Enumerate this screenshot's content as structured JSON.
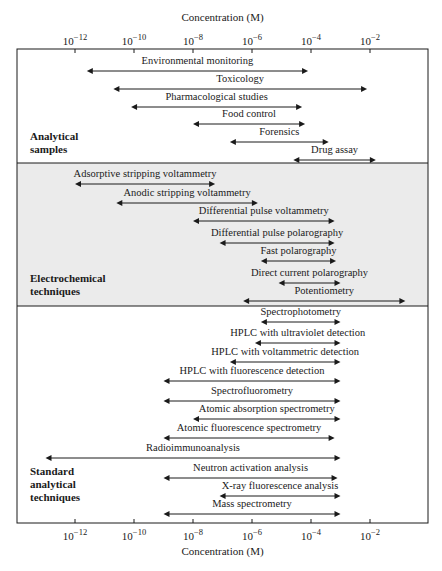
{
  "chart_data": {
    "type": "range-bar",
    "title": "",
    "xlabel": "Concentration (M)",
    "ylabel": "",
    "xscale": "log10",
    "xlim_exponent": [
      -13.5,
      -0.5
    ],
    "x_ticks": [
      -12,
      -10,
      -8,
      -6,
      -4,
      -2
    ],
    "x_tick_labels": [
      "10−12",
      "10−10",
      "10−8",
      "10−6",
      "10−4",
      "10−2"
    ],
    "top_axis": true,
    "bottom_axis": true,
    "groups": [
      {
        "name": "Analytical samples",
        "label_lines": [
          "Analytical",
          "samples"
        ],
        "shaded": false,
        "items": [
          {
            "label": "Environmental monitoring",
            "log_min": -11.6,
            "log_max": -4.1
          },
          {
            "label": "Toxicology",
            "log_min": -10.7,
            "log_max": -2.1
          },
          {
            "label": "Pharmacological studies",
            "log_min": -10.1,
            "log_max": -4.3
          },
          {
            "label": "Food control",
            "log_min": -8.0,
            "log_max": -4.2
          },
          {
            "label": "Forensics",
            "log_min": -6.75,
            "log_max": -3.4
          },
          {
            "label": "Drug assay",
            "log_min": -4.6,
            "log_max": -1.8
          }
        ]
      },
      {
        "name": "Electrochemical techniques",
        "label_lines": [
          "Electrochemical",
          "techniques"
        ],
        "shaded": true,
        "items": [
          {
            "label": "Adsorptive stripping voltammetry",
            "log_min": -12.0,
            "log_max": -7.25
          },
          {
            "label": "Anodic stripping voltammetry",
            "log_min": -10.6,
            "log_max": -5.8
          },
          {
            "label": "Differential pulse voltammetry",
            "log_min": -8.0,
            "log_max": -3.2
          },
          {
            "label": "Differential pulse polarography",
            "log_min": -7.1,
            "log_max": -3.2
          },
          {
            "label": "Fast polarography",
            "log_min": -5.7,
            "log_max": -3.15
          },
          {
            "label": "Direct current polarography",
            "log_min": -5.1,
            "log_max": -3.0
          },
          {
            "label": "Potentiometry",
            "log_min": -6.3,
            "log_max": -0.8
          }
        ]
      },
      {
        "name": "Standard analytical techniques",
        "label_lines": [
          "Standard",
          "analytical",
          "techniques"
        ],
        "shaded": false,
        "items": [
          {
            "label": "Spectrophotometry",
            "log_min": -5.7,
            "log_max": -3.0
          },
          {
            "label": "HPLC with ultraviolet detection",
            "log_min": -5.9,
            "log_max": -3.0
          },
          {
            "label": "HPLC with voltammetric detection",
            "log_min": -6.75,
            "log_max": -3.0
          },
          {
            "label": "HPLC with fluorescence detection",
            "log_min": -9.0,
            "log_max": -3.0
          },
          {
            "label": "Spectrofluorometry",
            "log_min": -9.0,
            "log_max": -3.0
          },
          {
            "label": "Atomic absorption spectrometry",
            "log_min": -8.0,
            "log_max": -3.0
          },
          {
            "label": "Atomic fluorescence spectrometry",
            "log_min": -9.0,
            "log_max": -3.2
          },
          {
            "label": "Radioimmunoanalysis",
            "log_min": -13.0,
            "log_max": -3.0
          },
          {
            "label": "Neutron activation analysis",
            "log_min": -9.0,
            "log_max": -3.1
          },
          {
            "label": "X-ray fluorescence analysis",
            "log_min": -7.1,
            "log_max": -3.0
          },
          {
            "label": "Mass spectrometry",
            "log_min": -9.0,
            "log_max": -3.0
          }
        ]
      }
    ]
  },
  "layout_px": {
    "frame": {
      "left": 17,
      "right": 428,
      "top": 49,
      "bottom": 523
    },
    "x_origin_px": 75,
    "x_origin_exp": -12,
    "px_per_decade": 29.5,
    "shade_band": {
      "top": 163,
      "bottom": 306
    },
    "dividers": [
      163,
      306
    ],
    "shade_color": "#ebebeb",
    "line_color": "#1a1a1a",
    "top_title_y": 21,
    "top_tick_label_y": 45,
    "bottom_tick_label_y": 540,
    "bottom_title_y": 555,
    "rows": [
      {
        "arrow_y": 71,
        "label_y": 64
      },
      {
        "arrow_y": 89,
        "label_y": 82
      },
      {
        "arrow_y": 107,
        "label_y": 100
      },
      {
        "arrow_y": 124,
        "label_y": 117
      },
      {
        "arrow_y": 142,
        "label_y": 135
      },
      {
        "arrow_y": 160,
        "label_y": 153
      },
      {
        "arrow_y": 184,
        "label_y": 177
      },
      {
        "arrow_y": 203,
        "label_y": 196
      },
      {
        "arrow_y": 221,
        "label_y": 214
      },
      {
        "arrow_y": 243,
        "label_y": 236
      },
      {
        "arrow_y": 261,
        "label_y": 254
      },
      {
        "arrow_y": 283,
        "label_y": 276
      },
      {
        "arrow_y": 301,
        "label_y": 294
      },
      {
        "arrow_y": 322,
        "label_y": 315
      },
      {
        "arrow_y": 343,
        "label_y": 336
      },
      {
        "arrow_y": 362,
        "label_y": 355
      },
      {
        "arrow_y": 381,
        "label_y": 374
      },
      {
        "arrow_y": 401,
        "label_y": 394
      },
      {
        "arrow_y": 419,
        "label_y": 412
      },
      {
        "arrow_y": 438,
        "label_y": 431
      },
      {
        "arrow_y": 458,
        "label_y": 451
      },
      {
        "arrow_y": 478,
        "label_y": 471
      },
      {
        "arrow_y": 496,
        "label_y": 489
      },
      {
        "arrow_y": 514,
        "label_y": 507
      }
    ],
    "group_label_x": 30,
    "group_label_y": [
      [
        140,
        153
      ],
      [
        282,
        295
      ],
      [
        475,
        488,
        501
      ]
    ]
  }
}
